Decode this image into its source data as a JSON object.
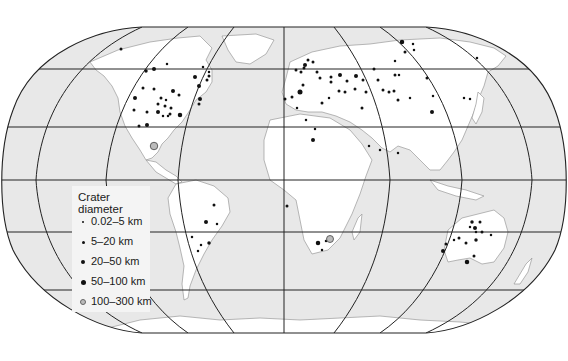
{
  "figure": {
    "type": "world map",
    "projection": "Robinson-like",
    "colors": {
      "ocean": "#e8e8e8",
      "land": "#ffffff",
      "grid": "#222222",
      "coast": "#888888",
      "marker": "#111111"
    }
  },
  "legend": {
    "title": "Crater diameter",
    "items": [
      {
        "label": "0.02–5 km",
        "size": 2
      },
      {
        "label": "5–20 km",
        "size": 3
      },
      {
        "label": "20–50 km",
        "size": 4
      },
      {
        "label": "50–100 km",
        "size": 5.5
      },
      {
        "label": "100–300 km",
        "size": 6,
        "ring": true
      }
    ]
  },
  "craters": [
    [
      121,
      49,
      3
    ],
    [
      146,
      71,
      3.5
    ],
    [
      154,
      69,
      4
    ],
    [
      167,
      64,
      2.5
    ],
    [
      154,
      89,
      3
    ],
    [
      143,
      88,
      3
    ],
    [
      173,
      91,
      4
    ],
    [
      179,
      95,
      3
    ],
    [
      166,
      100,
      2.5
    ],
    [
      161,
      98,
      3
    ],
    [
      171,
      108,
      3
    ],
    [
      158,
      104,
      3
    ],
    [
      165,
      106,
      3
    ],
    [
      158,
      112,
      4
    ],
    [
      170,
      114,
      3
    ],
    [
      163,
      116,
      2.5
    ],
    [
      168,
      116,
      2.5
    ],
    [
      180,
      115,
      4.5
    ],
    [
      135,
      98,
      4
    ],
    [
      134,
      110,
      3
    ],
    [
      147,
      112,
      3
    ],
    [
      139,
      126,
      3
    ],
    [
      147,
      125,
      4
    ],
    [
      154,
      146,
      5.5,
      1
    ],
    [
      195,
      77,
      4
    ],
    [
      199,
      86,
      4
    ],
    [
      209,
      76,
      3
    ],
    [
      200,
      99,
      4
    ],
    [
      199,
      104,
      3
    ],
    [
      207,
      80,
      3
    ],
    [
      209,
      72,
      2.5
    ],
    [
      203,
      67,
      2.5
    ],
    [
      305,
      65,
      4
    ],
    [
      304,
      68,
      3
    ],
    [
      301,
      72,
      3
    ],
    [
      308,
      60,
      3
    ],
    [
      296,
      70,
      3
    ],
    [
      313,
      62,
      3
    ],
    [
      317,
      72,
      3
    ],
    [
      320,
      78,
      3
    ],
    [
      331,
      77,
      3
    ],
    [
      340,
      75,
      4
    ],
    [
      347,
      81,
      3
    ],
    [
      303,
      85,
      3
    ],
    [
      300,
      92,
      5
    ],
    [
      292,
      97,
      3
    ],
    [
      285,
      99,
      3
    ],
    [
      297,
      108,
      2.5
    ],
    [
      306,
      120,
      2.5
    ],
    [
      315,
      129,
      2.5
    ],
    [
      313,
      140,
      4
    ],
    [
      322,
      103,
      3
    ],
    [
      329,
      98,
      2.5
    ],
    [
      345,
      92,
      3
    ],
    [
      355,
      89,
      3
    ],
    [
      363,
      80,
      3
    ],
    [
      339,
      91,
      3
    ],
    [
      331,
      82,
      3
    ],
    [
      356,
      76,
      4
    ],
    [
      366,
      92,
      3
    ],
    [
      362,
      108,
      3
    ],
    [
      395,
      75,
      3
    ],
    [
      405,
      52,
      3
    ],
    [
      413,
      44,
      2.5
    ],
    [
      414,
      50,
      2.5
    ],
    [
      402,
      42,
      4.5
    ],
    [
      395,
      61,
      2.5
    ],
    [
      410,
      98,
      2.5
    ],
    [
      427,
      78,
      3
    ],
    [
      433,
      96,
      2.5
    ],
    [
      432,
      112,
      4
    ],
    [
      398,
      100,
      3
    ],
    [
      389,
      92,
      3
    ],
    [
      374,
      69,
      3
    ],
    [
      378,
      80,
      3
    ],
    [
      383,
      90,
      3
    ],
    [
      394,
      91,
      3
    ],
    [
      399,
      75,
      2.5
    ],
    [
      477,
      58,
      2.5
    ],
    [
      464,
      98,
      2.5
    ],
    [
      470,
      99,
      2.5
    ],
    [
      398,
      153,
      2.5
    ],
    [
      369,
      146,
      2.5
    ],
    [
      380,
      150,
      2.5
    ],
    [
      214,
      205,
      3
    ],
    [
      206,
      222,
      4
    ],
    [
      201,
      245,
      2.5
    ],
    [
      198,
      251,
      2.5
    ],
    [
      209,
      243,
      3.5
    ],
    [
      192,
      237,
      2.5
    ],
    [
      217,
      224,
      2.5
    ],
    [
      287,
      206,
      3
    ],
    [
      318,
      243,
      4.5
    ],
    [
      326,
      241,
      2.5
    ],
    [
      330,
      239,
      5,
      1
    ],
    [
      322,
      250,
      2.5
    ],
    [
      472,
      222,
      3.5
    ],
    [
      475,
      228,
      4
    ],
    [
      470,
      227,
      2.5
    ],
    [
      480,
      222,
      3
    ],
    [
      482,
      232,
      3
    ],
    [
      476,
      240,
      3.5
    ],
    [
      466,
      243,
      3
    ],
    [
      459,
      238,
      3
    ],
    [
      446,
      244,
      3
    ],
    [
      443,
      251,
      4
    ],
    [
      467,
      262,
      4.5
    ],
    [
      474,
      256,
      3
    ],
    [
      476,
      232,
      2.5
    ],
    [
      491,
      235,
      2.5
    ],
    [
      454,
      240,
      2.5
    ]
  ]
}
